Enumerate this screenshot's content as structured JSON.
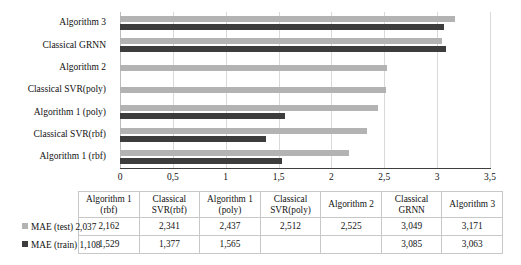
{
  "chart_data": {
    "type": "bar",
    "orientation": "horizontal",
    "title": "",
    "xlabel": "",
    "ylabel": "",
    "xlim": [
      0,
      3.5
    ],
    "grid": true,
    "legend_position": "table-left",
    "decimal_separator": ",",
    "categories": [
      "Algorithm 1 (rbf)",
      "Classical SVR(rbf)",
      "Algorithm 1 (poly)",
      "Classical SVR(poly)",
      "Algorithm 2",
      "Classical GRNN",
      "Algorithm 3"
    ],
    "categories_top_to_bottom": [
      "Algorithm 3",
      "Classical GRNN",
      "Algorithm 2",
      "Classical SVR(poly)",
      "Algorithm 1 (poly)",
      "Classical SVR(rbf)",
      "Algorithm 1 (rbf)"
    ],
    "series": [
      {
        "name": "MAE (test)",
        "color": "#b3b3b3",
        "values": [
          2.162,
          2.341,
          2.437,
          2.512,
          2.525,
          3.049,
          3.171
        ],
        "values_top_to_bottom": [
          3.171,
          3.049,
          2.525,
          2.512,
          2.437,
          2.341,
          2.162
        ]
      },
      {
        "name": "MAE (train)",
        "color": "#3d3d3d",
        "values": [
          1.529,
          1.377,
          1.565,
          null,
          null,
          3.085,
          3.063
        ],
        "values_top_to_bottom": [
          3.063,
          3.085,
          null,
          null,
          1.565,
          1.377,
          1.529
        ]
      }
    ],
    "xticks": [
      0,
      0.5,
      1,
      1.5,
      2,
      2.5,
      3,
      3.5
    ],
    "xtick_labels": [
      "0",
      "0,5",
      "1",
      "1,5",
      "2",
      "2,5",
      "3",
      "3,5"
    ]
  },
  "chart": {
    "xtick_labels": [
      "0",
      "0,5",
      "1",
      "1,5",
      "2",
      "2,5",
      "3",
      "3,5"
    ],
    "row_labels": [
      "Algorithm 3",
      "Classical GRNN",
      "Algorithm 2",
      "Classical SVR(poly)",
      "Algorithm 1 (poly)",
      "Classical SVR(rbf)",
      "Algorithm 1 (rbf)"
    ]
  },
  "table": {
    "corner": "",
    "headers": [
      "Algorithm 1 (rbf)",
      "Classical SVR(rbf)",
      "Algorithm 1 (poly)",
      "Classical SVR(poly)",
      "Algorithm 2",
      "Classical GRNN",
      "Algorithm 3"
    ],
    "rows": [
      {
        "legend_label": "MAE (test) 2,037",
        "series": "MAE (test)",
        "baseline": "2,037",
        "swatch": "test",
        "cells": [
          "2,162",
          "2,341",
          "2,437",
          "2,512",
          "2,525",
          "3,049",
          "3,171"
        ]
      },
      {
        "legend_label": "MAE (train) 1,108",
        "series": "MAE (train)",
        "baseline": "1,108",
        "swatch": "train",
        "cells": [
          "1,529",
          "1,377",
          "1,565",
          "",
          "",
          "3,085",
          "3,063"
        ]
      }
    ]
  },
  "colors": {
    "test_bar": "#b3b3b3",
    "train_bar": "#3d3d3d",
    "gridline": "#d9d9d9",
    "axis": "#3f3f3f",
    "table_border": "#c8c8c8",
    "text": "#111111"
  }
}
